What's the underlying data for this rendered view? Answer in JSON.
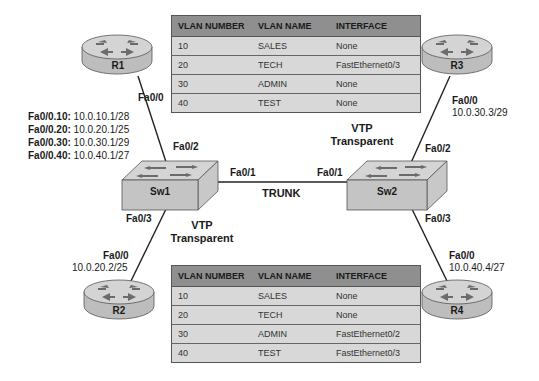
{
  "tables": {
    "sw1_vlans": {
      "headers": [
        "VLAN NUMBER",
        "VLAN NAME",
        "INTERFACE"
      ],
      "rows": [
        [
          "10",
          "SALES",
          "None"
        ],
        [
          "20",
          "TECH",
          "FastEthernet0/3"
        ],
        [
          "30",
          "ADMIN",
          "None"
        ],
        [
          "40",
          "TEST",
          "None"
        ]
      ]
    },
    "sw2_vlans": {
      "headers": [
        "VLAN NUMBER",
        "VLAN NAME",
        "INTERFACE"
      ],
      "rows": [
        [
          "10",
          "SALES",
          "None"
        ],
        [
          "20",
          "TECH",
          "None"
        ],
        [
          "30",
          "ADMIN",
          "FastEthernet0/2"
        ],
        [
          "40",
          "TEST",
          "FastEthernet0/3"
        ]
      ]
    }
  },
  "devices": {
    "r1": {
      "name": "R1",
      "port": "Fa0/0"
    },
    "r2": {
      "name": "R2",
      "port": "Fa0/0",
      "ip": "10.0.20.2/25"
    },
    "r3": {
      "name": "R3",
      "port": "Fa0/0",
      "ip": "10.0.30.3/29"
    },
    "r4": {
      "name": "R4",
      "port": "Fa0/0",
      "ip": "10.0.40.4/27"
    },
    "sw1": {
      "name": "Sw1",
      "port_r1": "Fa0/2",
      "port_trunk": "Fa0/1",
      "port_r2": "Fa0/3",
      "vtp_line1": "VTP",
      "vtp_line2": "Transparent"
    },
    "sw2": {
      "name": "Sw2",
      "port_r3": "Fa0/2",
      "port_trunk": "Fa0/1",
      "port_r4": "Fa0/3",
      "vtp_line1": "VTP",
      "vtp_line2": "Transparent"
    }
  },
  "r1_subinterfaces": [
    {
      "iface": "Fa0/0.10:",
      "ip": "10.0.10.1/28"
    },
    {
      "iface": "Fa0/0.20:",
      "ip": "10.0.20.1/25"
    },
    {
      "iface": "Fa0/0.30:",
      "ip": "10.0.30.1/29"
    },
    {
      "iface": "Fa0/0.40:",
      "ip": "10.0.40.1/27"
    }
  ],
  "trunk_label": "TRUNK",
  "colors": {
    "table_header": "#8f8f8f",
    "table_row": "#d8d8d8",
    "device_top": "#d4d4d4",
    "device_side": "#bdbdbd",
    "arrow": "#6b6b6b"
  }
}
